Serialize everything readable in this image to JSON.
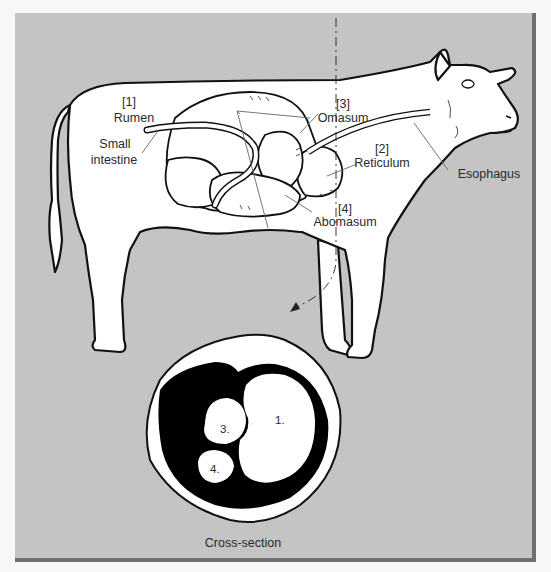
{
  "figure": {
    "background_color": "#c4c4c4",
    "frame_shadow_color": "#707070"
  },
  "labels": {
    "rumen": {
      "number": "[1]",
      "name": "Rumen"
    },
    "small_intestine": {
      "line1": "Small",
      "line2": "intestine"
    },
    "omasum": {
      "number": "[3]",
      "name": "Omasum"
    },
    "reticulum": {
      "number": "[2]",
      "name": "Reticulum"
    },
    "abomasum": {
      "number": "[4]",
      "name": "Abomasum"
    },
    "esophagus": {
      "name": "Esophagus"
    }
  },
  "cross_section": {
    "caption": "Cross-section",
    "compartments": [
      {
        "id": "rumen",
        "label": "1."
      },
      {
        "id": "omasum",
        "label": "3."
      },
      {
        "id": "abomasum",
        "label": "4."
      }
    ]
  }
}
